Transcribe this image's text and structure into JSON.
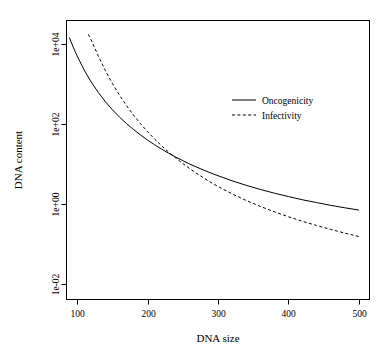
{
  "chart_data": {
    "type": "line",
    "title": "",
    "xlabel": "DNA size",
    "ylabel": "DNA content",
    "xlim": [
      85,
      515
    ],
    "ylim": [
      0.004,
      40000
    ],
    "yscale": "log",
    "xscale": "linear",
    "grid": false,
    "box": true,
    "legend_position": "top-right",
    "xticks": [
      100,
      200,
      300,
      400,
      500
    ],
    "xticklabels": [
      "100",
      "200",
      "300",
      "400",
      "500"
    ],
    "yticks": [
      0.01,
      1,
      100,
      10000
    ],
    "yticklabels": [
      "1e-02",
      "1e+00",
      "1e+02",
      "1e+04"
    ],
    "series": [
      {
        "name": "Oncogenicity",
        "style": "solid",
        "color": "#000000",
        "x": [
          89,
          95,
          100,
          110,
          120,
          130,
          140,
          150,
          160,
          170,
          180,
          190,
          200,
          210,
          220,
          230,
          240,
          250,
          260,
          270,
          280,
          290,
          300,
          320,
          340,
          360,
          380,
          400,
          420,
          440,
          460,
          480,
          500
        ],
        "y": [
          15000,
          8200,
          5200,
          2300,
          1150,
          630,
          370,
          232,
          152,
          104,
          74,
          54,
          40,
          30.5,
          23.7,
          18.7,
          15.0,
          12.2,
          10.0,
          8.35,
          7.02,
          5.96,
          5.1,
          3.81,
          2.93,
          2.31,
          1.86,
          1.53,
          1.27,
          1.08,
          0.92,
          0.8,
          0.7
        ]
      },
      {
        "name": "Infectivity",
        "style": "dashed",
        "color": "#000000",
        "x": [
          116,
          120,
          130,
          140,
          150,
          160,
          170,
          180,
          190,
          200,
          210,
          220,
          230,
          240,
          250,
          260,
          270,
          280,
          290,
          300,
          320,
          340,
          360,
          380,
          400,
          420,
          440,
          460,
          480,
          500
        ],
        "y": [
          18000,
          13000,
          5200,
          2250,
          1060,
          540,
          295,
          170,
          103,
          65,
          42.5,
          28.7,
          19.9,
          14.2,
          10.3,
          7.65,
          5.78,
          4.44,
          3.46,
          2.74,
          1.79,
          1.22,
          0.866,
          0.634,
          0.476,
          0.366,
          0.287,
          0.229,
          0.185,
          0.152
        ]
      }
    ],
    "legend": [
      {
        "label": "Oncogenicity",
        "style": "solid"
      },
      {
        "label": "Infectivity",
        "style": "dashed"
      }
    ]
  }
}
